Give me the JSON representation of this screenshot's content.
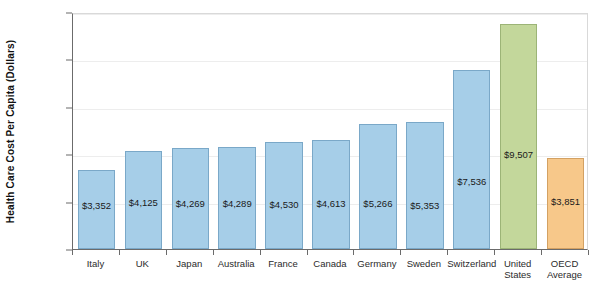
{
  "chart_data": {
    "type": "bar",
    "title": "",
    "xlabel": "",
    "ylabel": "Health Care Cost Per Capita (Dollars)",
    "ylim": [
      0,
      10000
    ],
    "ytick_values": [
      0,
      2000,
      4000,
      6000,
      8000,
      10000
    ],
    "ytick_labels": [
      "$0",
      "$2,000",
      "$4,000",
      "$6,000",
      "$8,000",
      "$10,000"
    ],
    "grid": true,
    "legend": "none",
    "categories": [
      "Italy",
      "UK",
      "Japan",
      "Australia",
      "France",
      "Canada",
      "Germany",
      "Sweden",
      "Switzerland",
      "United States",
      "OECD Average"
    ],
    "values": [
      3352,
      4125,
      4269,
      4289,
      4530,
      4613,
      5266,
      5353,
      7536,
      9507,
      3851
    ],
    "data_labels": [
      "$3,352",
      "$4,125",
      "$4,269",
      "$4,289",
      "$4,530",
      "$4,613",
      "$5,266",
      "$5,353",
      "$7,536",
      "$9,507",
      "$3,851"
    ],
    "bar_colors": [
      "#a6cee8",
      "#a6cee8",
      "#a6cee8",
      "#a6cee8",
      "#a6cee8",
      "#a6cee8",
      "#a6cee8",
      "#a6cee8",
      "#a6cee8",
      "#c3d79b",
      "#f7c88a"
    ],
    "series_colors": {
      "country": "#a6cee8",
      "united_states": "#c3d79b",
      "oecd_average": "#f7c88a"
    }
  }
}
